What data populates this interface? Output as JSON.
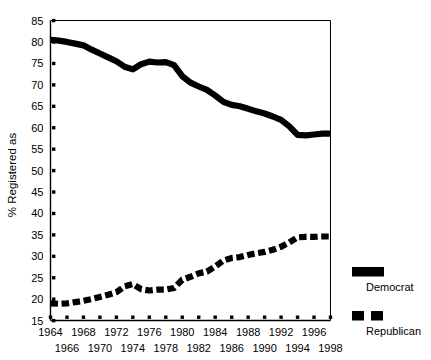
{
  "chart_data": {
    "type": "line",
    "title": "",
    "xlabel": "",
    "ylabel": "% Registered as",
    "xlim": [
      1964,
      1998
    ],
    "ylim": [
      15,
      85
    ],
    "ytick_step": 5,
    "xtick_step": 2,
    "grid": false,
    "legend_position": "right",
    "yticks": [
      15,
      20,
      25,
      30,
      35,
      40,
      45,
      50,
      55,
      60,
      65,
      70,
      75,
      80,
      85
    ],
    "x": [
      1964,
      1965,
      1966,
      1967,
      1968,
      1969,
      1970,
      1971,
      1972,
      1973,
      1974,
      1975,
      1976,
      1977,
      1978,
      1979,
      1980,
      1981,
      1982,
      1983,
      1984,
      1985,
      1986,
      1987,
      1988,
      1989,
      1990,
      1991,
      1992,
      1993,
      1994,
      1995,
      1996,
      1997,
      1998
    ],
    "xticks": [
      1964,
      1966,
      1968,
      1970,
      1972,
      1974,
      1976,
      1978,
      1980,
      1982,
      1984,
      1986,
      1988,
      1990,
      1992,
      1994,
      1996,
      1998
    ],
    "xticklabels_row1": [
      "1964",
      "1968",
      "1972",
      "1976",
      "1980",
      "1984",
      "1988",
      "1992",
      "1996"
    ],
    "xticklabels_row2": [
      "1966",
      "1970",
      "1974",
      "1978",
      "1982",
      "1986",
      "1990",
      "1994",
      "1998"
    ],
    "series": [
      {
        "name": "Democrat",
        "style": "solid",
        "color": "#000000",
        "values": [
          80.5,
          80.3,
          80.0,
          79.6,
          79.2,
          78.2,
          77.3,
          76.4,
          75.5,
          74.2,
          73.6,
          74.8,
          75.4,
          75.2,
          75.3,
          74.6,
          72.0,
          70.5,
          69.6,
          68.8,
          67.5,
          66.0,
          65.3,
          65.0,
          64.4,
          63.8,
          63.3,
          62.6,
          61.8,
          60.3,
          58.3,
          58.2,
          58.4,
          58.6,
          58.6
        ]
      },
      {
        "name": "Republican",
        "style": "dashed",
        "color": "#000000",
        "values": [
          19.0,
          18.9,
          19.0,
          19.3,
          19.6,
          20.0,
          20.5,
          21.0,
          21.6,
          23.0,
          23.5,
          22.3,
          22.0,
          22.2,
          22.2,
          22.6,
          24.5,
          25.2,
          26.0,
          26.4,
          27.6,
          29.0,
          29.6,
          29.8,
          30.3,
          30.7,
          31.0,
          31.5,
          32.2,
          33.2,
          34.4,
          34.5,
          34.5,
          34.6,
          34.6
        ]
      }
    ]
  },
  "legend": {
    "items": [
      {
        "label": "Democrat",
        "marker": "solid-bar"
      },
      {
        "label": "Republican",
        "marker": "dashed-bar"
      }
    ]
  }
}
